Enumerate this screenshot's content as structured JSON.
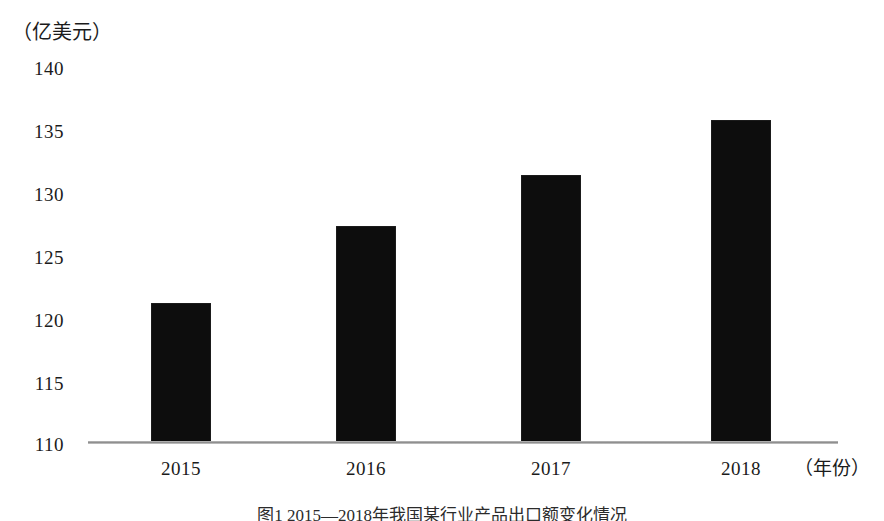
{
  "chart_data": {
    "type": "bar",
    "title": "",
    "caption": "图1 2015—2018年我国某行业产品出口额变化情况",
    "categories": [
      "2015",
      "2016",
      "2017",
      "2018"
    ],
    "values": [
      121.0,
      127.0,
      131.0,
      135.3
    ],
    "series": [
      {
        "name": "出口额",
        "values": [
          121.0,
          127.0,
          131.0,
          135.3
        ]
      }
    ],
    "xlabel": "（年份）",
    "ylabel": "（亿美元）",
    "ylim": [
      110,
      140
    ],
    "yticks": [
      110,
      115,
      120,
      125,
      130,
      135,
      140
    ],
    "ytick_labels": [
      "110",
      "115",
      "120",
      "125",
      "130",
      "135",
      "140"
    ],
    "grid": false,
    "legend": false,
    "legend_position": "none",
    "bar_color": "#0d0d0d",
    "axis_color": "#8f8f8f"
  },
  "axis": {
    "y_unit_label": "（亿美元）",
    "x_unit_label": "（年份）"
  }
}
